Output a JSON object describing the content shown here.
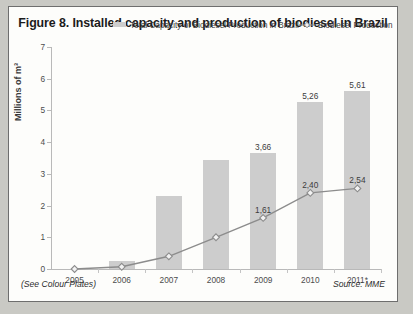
{
  "figure": {
    "title": "Figure 8. Installed capacity and production of biodiesel in Brazil",
    "see_colour_plates": "(See Colour Plates)",
    "source": "Source: MME"
  },
  "legend": {
    "bar_series_label": "Total Capacity of Biodiesel Production in Brazil",
    "line_series_label": "Biodiesel Production"
  },
  "colors": {
    "bar_fill": "#cdcdcd",
    "line_stroke": "#8c8c8c",
    "marker_fill": "#f2f2f2",
    "axis": "#b9b9b9",
    "text": "#3c3c3c",
    "title": "#1b1b1b",
    "panel_background": "#fdfdfb",
    "panel_border": "#6e6e6e",
    "page_background": "#c9c9c4"
  },
  "chart_data": {
    "type": "bar",
    "title": "Figure 8. Installed capacity and production of biodiesel in Brazil",
    "xlabel": "",
    "ylabel": "Millions of m³",
    "ylim": [
      0,
      7
    ],
    "yticks": [
      0,
      1,
      2,
      3,
      4,
      5,
      6,
      7
    ],
    "ytick_labels": [
      "0",
      "1",
      "2",
      "3",
      "4",
      "5",
      "6",
      "7"
    ],
    "grid": false,
    "legend_position": "top",
    "categories": [
      "2005",
      "2006",
      "2007",
      "2008",
      "2009",
      "2010",
      "2011*"
    ],
    "series": [
      {
        "name": "Total Capacity of Biodiesel Production in Brazil",
        "type": "bar",
        "values": [
          0,
          0.25,
          2.3,
          3.45,
          3.66,
          5.26,
          5.61
        ],
        "labels": [
          "",
          "",
          "",
          "",
          "3,66",
          "5,26",
          "5,61"
        ]
      },
      {
        "name": "Biodiesel Production",
        "type": "line",
        "values": [
          0.0,
          0.07,
          0.4,
          1.0,
          1.61,
          2.4,
          2.54
        ],
        "labels": [
          "",
          "",
          "",
          "",
          "1,61",
          "2,40",
          "2,54"
        ]
      }
    ]
  }
}
